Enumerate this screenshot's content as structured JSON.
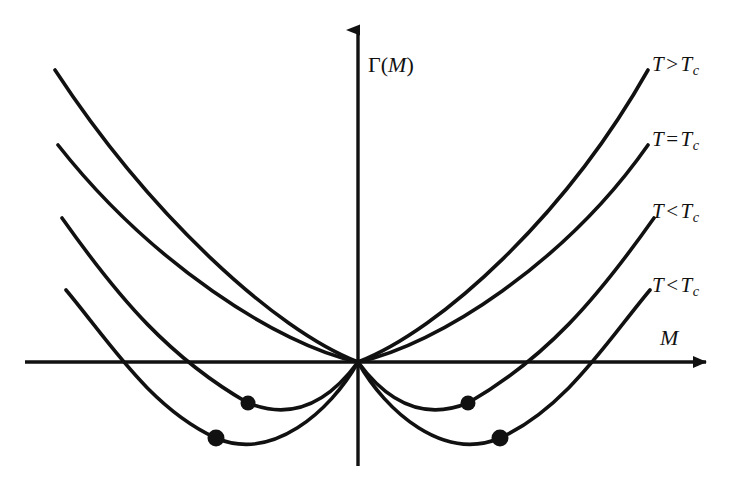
{
  "figure": {
    "background_color": "#ffffff",
    "ink_color": "#111111"
  },
  "axes": {
    "y_label": "Γ(M)",
    "y_label_gamma": "Γ",
    "y_label_paren_open": "(",
    "y_label_m": "M",
    "y_label_paren_close": ")",
    "x_label": "M",
    "x_axis_y": 362,
    "y_axis_x": 358,
    "x_axis_start": 25,
    "x_axis_end": 718,
    "y_axis_top": 18,
    "y_axis_bottom": 466,
    "origin": [
      358,
      362
    ]
  },
  "labels": [
    {
      "id": "label-t-greater",
      "text_t": "T",
      "operator": ">",
      "text_tc": "T",
      "subscript": "c",
      "full": "T > Tc",
      "x": 652,
      "y": 52
    },
    {
      "id": "label-t-equal",
      "text_t": "T",
      "operator": "=",
      "text_tc": "T",
      "subscript": "c",
      "full": "T = Tc",
      "x": 652,
      "y": 127
    },
    {
      "id": "label-t-less-1",
      "text_t": "T",
      "operator": "<",
      "text_tc": "T",
      "subscript": "c",
      "full": "T < Tc",
      "x": 652,
      "y": 199
    },
    {
      "id": "label-t-less-2",
      "text_t": "T",
      "operator": "<",
      "text_tc": "T",
      "subscript": "c",
      "full": "T < Tc",
      "x": 652,
      "y": 273
    }
  ],
  "chart_data": {
    "type": "line",
    "title": "Γ(M)",
    "xlabel": "M",
    "ylabel": "Γ(M)",
    "grid": false,
    "legend_position": "right-inline",
    "axis_style": "arrowed-cartesian",
    "origin_note": "all curves pass through the origin (0,0)",
    "symmetry": "even function of M",
    "series": [
      {
        "name": "T > Tc",
        "shape": "single-well parabola, minimum at M = 0",
        "curvature": "a > 0",
        "minima_M": [
          0
        ],
        "has_markers": false,
        "path": "M 55 70 C 150 215, 275 330, 358 362 C 441 330, 566 215, 648 70"
      },
      {
        "name": "T = Tc",
        "shape": "flat quartic, marginal minimum at M = 0",
        "curvature": "a = 0",
        "minima_M": [
          0
        ],
        "has_markers": false,
        "path": "M 58 145 C 150 262, 278 345, 358 362 C 438 345, 566 262, 648 145"
      },
      {
        "name": "T < Tc (shallow)",
        "shape": "double well, shallow",
        "curvature": "a < 0",
        "minima_M": [
          -110,
          110
        ],
        "has_markers": true,
        "axis_crossings_x": [
          172,
          544
        ],
        "path": "M 62 218 C 120 300, 170 358, 248 403 C 300 424, 336 392, 358 362 C 380 392, 416 424, 468 403 C 546 358, 596 300, 654 218"
      },
      {
        "name": "T < Tc (deep)",
        "shape": "double well, deep",
        "curvature": "a << 0",
        "minima_M": [
          -142,
          142
        ],
        "has_markers": true,
        "axis_crossings_x": [
          122,
          594
        ],
        "path": "M 66 290 C 108 340, 150 408, 216 438 C 272 462, 330 412, 358 362 C 386 412, 444 462, 500 438 C 566 408, 608 340, 650 290"
      }
    ],
    "markers": [
      {
        "id": "minimum-marker-left-shallow",
        "series": "T < Tc (shallow)",
        "x": 248,
        "y": 403,
        "radius": 7.5,
        "color": "#111111"
      },
      {
        "id": "minimum-marker-right-shallow",
        "series": "T < Tc (shallow)",
        "x": 468,
        "y": 403,
        "radius": 7.5,
        "color": "#111111"
      },
      {
        "id": "minimum-marker-left-deep",
        "series": "T < Tc (deep)",
        "x": 216,
        "y": 438,
        "radius": 8.5,
        "color": "#111111"
      },
      {
        "id": "minimum-marker-right-deep",
        "series": "T < Tc (deep)",
        "x": 500,
        "y": 438,
        "radius": 8.5,
        "color": "#111111"
      }
    ]
  }
}
